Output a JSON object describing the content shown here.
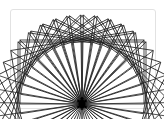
{
  "figure": {
    "pivot": {
      "x": 82,
      "y": 104
    },
    "rectangle": {
      "width": 124,
      "height": 64
    },
    "rotation_count": 10,
    "rotation_step_deg": 9,
    "stroke_color": "#222222",
    "turtle_color": "#000000",
    "card_border_color": "#e2e2e2"
  }
}
